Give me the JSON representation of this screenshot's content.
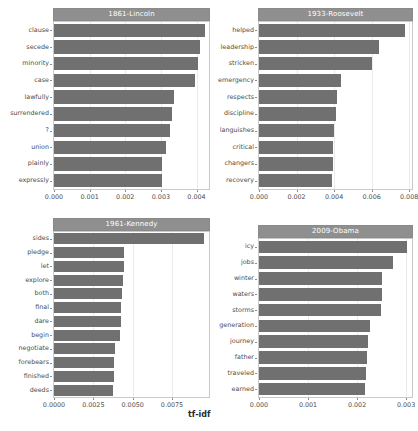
{
  "figure": {
    "axis_title_x": "tf-idf",
    "bar_color": "#707070",
    "strip_color": "#8f8f8f",
    "panel_bg": "#ffffff",
    "grid_color": "#ebebeb"
  },
  "chart_data": [
    {
      "type": "bar",
      "orientation": "horizontal",
      "title": "1861-Lincoln",
      "xlabel": "tf-idf",
      "ylabel": "",
      "xlim": [
        0,
        0.00435
      ],
      "grid": true,
      "ticks": [
        "0.000",
        "0.001",
        "0.002",
        "0.003",
        "0.004"
      ],
      "tick_values": [
        0.0,
        0.001,
        0.002,
        0.003,
        0.004
      ],
      "categories": [
        "clause",
        "secede",
        "minority",
        "case",
        "lawfully",
        "surrendered",
        "?",
        "union",
        "plainly",
        "expressly"
      ],
      "values": [
        0.00425,
        0.00409,
        0.00405,
        0.00396,
        0.00336,
        0.00332,
        0.00326,
        0.00313,
        0.00304,
        0.00302
      ]
    },
    {
      "type": "bar",
      "orientation": "horizontal",
      "title": "1933-Roosevelt",
      "xlabel": "tf-idf",
      "ylabel": "",
      "xlim": [
        0,
        0.00815
      ],
      "grid": true,
      "ticks": [
        "0.000",
        "0.002",
        "0.004",
        "0.006",
        "0.008"
      ],
      "tick_values": [
        0.0,
        0.002,
        0.004,
        0.006,
        0.008
      ],
      "categories": [
        "helped",
        "leadership",
        "stricken",
        "emergency",
        "respects",
        "discipline",
        "languishes",
        "critical",
        "changers",
        "recovery"
      ],
      "values": [
        0.0078,
        0.00639,
        0.006,
        0.00437,
        0.00417,
        0.00412,
        0.00398,
        0.00396,
        0.00393,
        0.0039
      ]
    },
    {
      "type": "bar",
      "orientation": "horizontal",
      "title": "1961-Kennedy",
      "xlabel": "tf-idf",
      "ylabel": "",
      "xlim": [
        0,
        0.00985
      ],
      "grid": true,
      "ticks": [
        "0.0000",
        "0.0025",
        "0.0050",
        "0.0075"
      ],
      "tick_values": [
        0.0,
        0.0025,
        0.005,
        0.0075
      ],
      "categories": [
        "sides",
        "pledge",
        "let",
        "explore",
        "both",
        "final",
        "dare",
        "begin",
        "negotiate",
        "forebears",
        "finished",
        "deeds"
      ],
      "values": [
        0.00952,
        0.00446,
        0.00443,
        0.00441,
        0.0043,
        0.00426,
        0.00423,
        0.00417,
        0.00385,
        0.00381,
        0.00379,
        0.00376
      ]
    },
    {
      "type": "bar",
      "orientation": "horizontal",
      "title": "2009-Obama",
      "xlabel": "tf-idf",
      "ylabel": "",
      "xlim": [
        0,
        0.00312
      ],
      "grid": true,
      "ticks": [
        "0.000",
        "0.001",
        "0.002",
        "0.003"
      ],
      "tick_values": [
        0.0,
        0.001,
        0.002,
        0.003
      ],
      "categories": [
        "icy",
        "jobs",
        "winter",
        "waters",
        "storms",
        "generation",
        "journey",
        "father",
        "traveled",
        "earned"
      ],
      "values": [
        0.00301,
        0.00273,
        0.00251,
        0.0025,
        0.00249,
        0.00227,
        0.00222,
        0.00221,
        0.00218,
        0.00217
      ]
    }
  ]
}
